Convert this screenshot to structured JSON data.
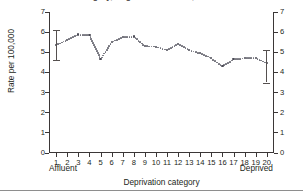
{
  "figure": {
    "title": "category, England and Wales, 1997-99",
    "bottom_rule_color": "#8e8e8e"
  },
  "axes": {
    "ylabel": "Rate per 100,000",
    "xlabel": "Deprivation category",
    "left_end_label": "Affluent",
    "right_end_label": "Deprived",
    "y_ticks": [
      "0",
      "1",
      "2",
      "3",
      "4",
      "5",
      "6",
      "7"
    ],
    "x_ticks": [
      "1",
      "2",
      "3",
      "4",
      "5",
      "6",
      "7",
      "8",
      "9",
      "10",
      "11",
      "12",
      "13",
      "14",
      "15",
      "16",
      "17",
      "18",
      "19",
      "20"
    ]
  },
  "chart_data": {
    "type": "line",
    "title": "category, England and Wales, 1997-99",
    "xlabel": "Deprivation category",
    "ylabel": "Rate per 100,000",
    "xlim": [
      0.35,
      20.65
    ],
    "ylim": [
      0,
      7
    ],
    "grid": false,
    "legend": null,
    "line_style": "dotted",
    "marker": "small filled circle",
    "marker_color": "#4a4a55",
    "categories": [
      1,
      2,
      3,
      4,
      5,
      6,
      7,
      8,
      9,
      10,
      11,
      12,
      13,
      14,
      15,
      16,
      17,
      18,
      19,
      20
    ],
    "category_labels": [
      "1",
      "2",
      "3",
      "4",
      "5",
      "6",
      "7",
      "8",
      "9",
      "10",
      "11",
      "12",
      "13",
      "14",
      "15",
      "16",
      "17",
      "18",
      "19",
      "20"
    ],
    "values": [
      5.35,
      5.62,
      5.88,
      5.85,
      4.65,
      5.5,
      5.75,
      5.78,
      5.3,
      5.28,
      5.1,
      5.4,
      5.1,
      4.95,
      4.7,
      4.3,
      4.65,
      4.7,
      4.72,
      4.45
    ],
    "error_bars": [
      {
        "category": 1,
        "value": 5.35,
        "low": 4.6,
        "high": 6.1
      },
      {
        "category": 20,
        "value": 4.45,
        "low": 3.5,
        "high": 5.1
      }
    ],
    "annotations": [
      {
        "text": "Affluent",
        "position": "below-axis-left"
      },
      {
        "text": "Deprived",
        "position": "below-axis-right"
      }
    ]
  }
}
